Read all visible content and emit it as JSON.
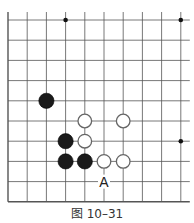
{
  "diagram": {
    "type": "go-board-fragment",
    "caption": "图 10–31",
    "grid": {
      "columns": 10,
      "rows": 10,
      "origin_x": 8,
      "origin_y": 20,
      "spacing_x": 19.2,
      "spacing_y": 20.2,
      "left_edge": true,
      "bottom_edge": true,
      "line_color": "#555555"
    },
    "star_points": [
      {
        "col": 3,
        "row": 0
      },
      {
        "col": 9,
        "row": 0
      },
      {
        "col": 9,
        "row": 6
      }
    ],
    "stones": [
      {
        "color": "black",
        "col": 2,
        "row": 4
      },
      {
        "color": "black",
        "col": 3,
        "row": 6
      },
      {
        "color": "black",
        "col": 3,
        "row": 7
      },
      {
        "color": "black",
        "col": 4,
        "row": 7
      },
      {
        "color": "white",
        "col": 4,
        "row": 5
      },
      {
        "color": "white",
        "col": 6,
        "row": 5
      },
      {
        "color": "white",
        "col": 4,
        "row": 6
      },
      {
        "color": "white",
        "col": 5,
        "row": 7
      },
      {
        "color": "white",
        "col": 6,
        "row": 7
      }
    ],
    "labels": [
      {
        "text": "A",
        "col": 5,
        "row": 8
      }
    ]
  }
}
